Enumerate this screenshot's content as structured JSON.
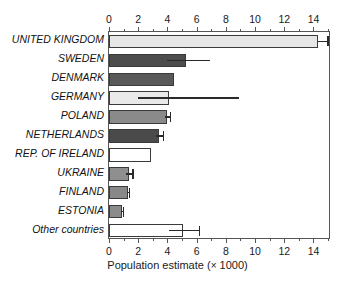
{
  "chart_data": {
    "type": "bar",
    "orientation": "horizontal",
    "title": "",
    "xlabel": "Population estimate (× 1000)",
    "ylabel": "",
    "xlim": [
      0,
      15.2
    ],
    "xticks": [
      0,
      2,
      4,
      6,
      8,
      10,
      12,
      14
    ],
    "xticklabels": [
      "0",
      "2",
      "4",
      "6",
      "8",
      "10",
      "12",
      "14"
    ],
    "minor_tick_step": 1,
    "grid": false,
    "legend": "none",
    "axis_top": true,
    "axis_bottom": true,
    "categories": [
      "UNITED KINGDOM",
      "SWEDEN",
      "DENMARK",
      "GERMANY",
      "POLAND",
      "NETHERLANDS",
      "REP. OF IRELAND",
      "UKRAINE",
      "FINLAND",
      "ESTONIA",
      "Other countries"
    ],
    "values": [
      14.3,
      5.25,
      4.45,
      4.1,
      4.0,
      3.45,
      2.9,
      1.4,
      1.3,
      0.9,
      5.1
    ],
    "errors_low": [
      14.3,
      4.0,
      null,
      2.0,
      3.85,
      3.2,
      null,
      1.15,
      1.25,
      0.8,
      4.1
    ],
    "errors_high": [
      15.0,
      6.9,
      null,
      8.9,
      4.2,
      3.75,
      null,
      1.65,
      1.4,
      1.0,
      6.2
    ],
    "bar_colors": [
      "#e6e6e6",
      "#4d4d4d",
      "#595959",
      "#e9e9e9",
      "#8a8a8a",
      "#4a4a4a",
      "#ffffff",
      "#8f8f8f",
      "#888888",
      "#8b8b8b",
      "#ffffff"
    ],
    "bar_edge_color": "#3a3a3a",
    "error_color": "#2a2a2a",
    "axis_color": "#555555"
  },
  "axis_title_main": "Population estimate (",
  "axis_title_times": "×",
  "axis_title_unit": " 1000)"
}
